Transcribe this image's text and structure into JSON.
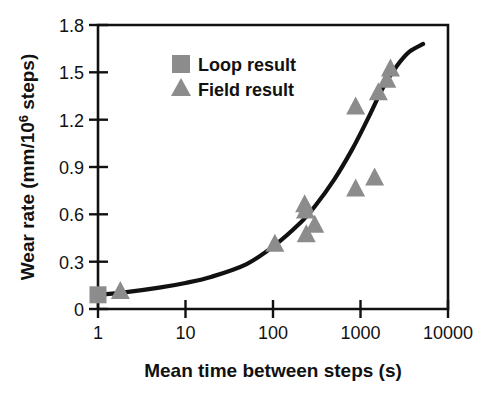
{
  "chart_data": {
    "type": "scatter",
    "title": "",
    "xlabel": "Mean time between steps (s)",
    "ylabel": "Wear rate (mm/10⁶ steps)",
    "ylabel_parts": {
      "prefix": "Wear rate (mm/10",
      "superscript": "6",
      "suffix": " steps)"
    },
    "xscale": "log",
    "yscale": "linear",
    "xlim": [
      1,
      10000
    ],
    "ylim": [
      0,
      1.8
    ],
    "grid": false,
    "xticks": [
      1,
      10,
      100,
      1000,
      10000
    ],
    "xtick_labels": [
      "1",
      "10",
      "100",
      "1000",
      "10000"
    ],
    "yticks": [
      0,
      0.3,
      0.6,
      0.9,
      1.2,
      1.5,
      1.8
    ],
    "ytick_labels": [
      "0",
      "0.3",
      "0.6",
      "0.9",
      "1.2",
      "1.5",
      "1.8"
    ],
    "legend_position": "upper-left-inside",
    "series": [
      {
        "name": "Loop result",
        "marker": "square",
        "color": "#8c8c8c",
        "points": [
          {
            "x": 1.0,
            "y": 0.09
          }
        ]
      },
      {
        "name": "Field result",
        "marker": "triangle",
        "color": "#8c8c8c",
        "points": [
          {
            "x": 1.8,
            "y": 0.12
          },
          {
            "x": 105,
            "y": 0.42
          },
          {
            "x": 230,
            "y": 0.67
          },
          {
            "x": 235,
            "y": 0.63
          },
          {
            "x": 240,
            "y": 0.48
          },
          {
            "x": 300,
            "y": 0.54
          },
          {
            "x": 880,
            "y": 0.77
          },
          {
            "x": 880,
            "y": 1.29
          },
          {
            "x": 1450,
            "y": 0.84
          },
          {
            "x": 1600,
            "y": 1.38
          },
          {
            "x": 2000,
            "y": 1.46
          },
          {
            "x": 2200,
            "y": 1.53
          }
        ]
      }
    ],
    "fit_curve": {
      "name": "power-law trend",
      "color": "#111111",
      "points": [
        {
          "x": 1,
          "y": 0.09
        },
        {
          "x": 2,
          "y": 0.105
        },
        {
          "x": 5,
          "y": 0.135
        },
        {
          "x": 10,
          "y": 0.165
        },
        {
          "x": 20,
          "y": 0.205
        },
        {
          "x": 50,
          "y": 0.285
        },
        {
          "x": 100,
          "y": 0.395
        },
        {
          "x": 200,
          "y": 0.54
        },
        {
          "x": 300,
          "y": 0.65
        },
        {
          "x": 500,
          "y": 0.82
        },
        {
          "x": 800,
          "y": 1.01
        },
        {
          "x": 1200,
          "y": 1.2
        },
        {
          "x": 1800,
          "y": 1.4
        },
        {
          "x": 2600,
          "y": 1.54
        },
        {
          "x": 3600,
          "y": 1.63
        },
        {
          "x": 5200,
          "y": 1.68
        }
      ]
    },
    "legend": [
      {
        "label": "Loop result",
        "marker": "square",
        "color": "#8c8c8c"
      },
      {
        "label": "Field result",
        "marker": "triangle",
        "color": "#8c8c8c"
      }
    ]
  }
}
